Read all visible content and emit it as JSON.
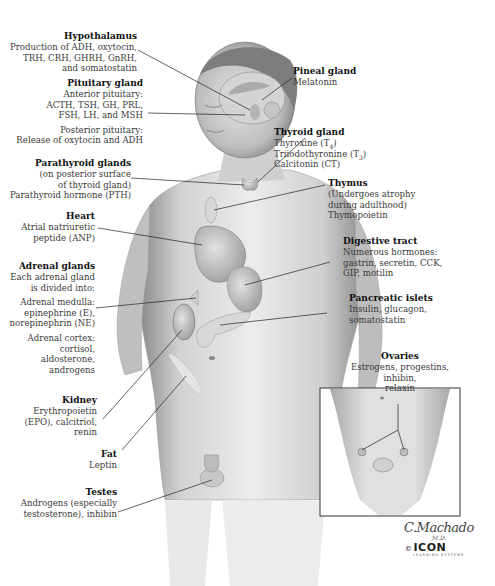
{
  "figure": {
    "labels": {
      "hypothalamus": {
        "title": "Hypothalamus",
        "lines": [
          "Production of ADH, oxytocin,",
          "TRH, CRH, GHRH, GnRH,",
          "and somatostatin"
        ]
      },
      "pituitary": {
        "title": "Pituitary gland",
        "anterior": [
          "Anterior pituitary:",
          "ACTH, TSH, GH, PRL,",
          "FSH, LH, and MSH"
        ],
        "posterior": [
          "Posterior pituitary:",
          "Release of oxytocin and ADH"
        ]
      },
      "parathyroid": {
        "title": "Parathyroid glands",
        "lines": [
          "(on posterior surface",
          "of thyroid gland)",
          "Parathyroid hormone (PTH)"
        ]
      },
      "heart": {
        "title": "Heart",
        "lines": [
          "Atrial natriuretic",
          "peptide (ANP)"
        ]
      },
      "adrenal": {
        "title": "Adrenal glands",
        "lines": [
          "Each adrenal gland",
          "is divided into:"
        ],
        "medulla": [
          "Adrenal medulla:",
          "epinephrine (E),",
          "norepinephrin (NE)"
        ],
        "cortex": [
          "Adrenal cortex:",
          "cortisol,",
          "aldosterone,",
          "androgens"
        ]
      },
      "kidney": {
        "title": "Kidney",
        "lines": [
          "Erythropoietin",
          "(EPO), calcitriol,",
          "renin"
        ]
      },
      "fat": {
        "title": "Fat",
        "lines": [
          "Leptin"
        ]
      },
      "testes": {
        "title": "Testes",
        "lines": [
          "Androgens (especially",
          "testosterone), inhibin"
        ]
      },
      "pineal": {
        "title": "Pineal gland",
        "lines": [
          "Melatonin"
        ]
      },
      "thyroid": {
        "title": "Thyroid gland",
        "line1": "Thyroxine (T",
        "line1_sub": "4",
        "line2": "Triiodothyronine (T",
        "line2_sub": "3",
        "close": ")",
        "line3": "Calcitonin (CT)"
      },
      "thymus": {
        "title": "Thymus",
        "lines": [
          "(Undergoes atrophy",
          "during adulthood)",
          "Thymopoietin"
        ]
      },
      "digestive": {
        "title": "Digestive tract",
        "lines": [
          "Numerous hormones:",
          "gastrin, secretin, CCK,",
          "GIP, motilin"
        ]
      },
      "pancreatic": {
        "title": "Pancreatic islets",
        "lines": [
          "Insulin, glucagon,",
          "somatostatin"
        ]
      },
      "ovaries": {
        "title": "Ovaries",
        "lines": [
          "Estrogens, progestins, inhibin,",
          "relaxin"
        ]
      }
    },
    "signature": {
      "name": "C.Machado",
      "suffix": "M.D."
    },
    "logo": {
      "copyright": "©",
      "brand": "ICON",
      "sub": "LEARNING SYSTEMS"
    }
  }
}
